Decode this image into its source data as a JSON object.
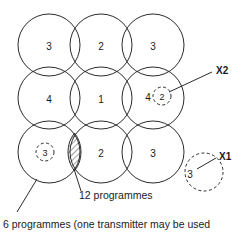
{
  "figure": {
    "stroke_color": "#2b2b2b",
    "background_color": "#ffffff",
    "cells": [
      {
        "id": "cell-r1c1",
        "label": "3",
        "cx": 49,
        "cy": 45,
        "r": 31
      },
      {
        "id": "cell-r1c2",
        "label": "2",
        "cx": 101,
        "cy": 45,
        "r": 31
      },
      {
        "id": "cell-r1c3",
        "label": "3",
        "cx": 153,
        "cy": 45,
        "r": 31
      },
      {
        "id": "cell-r2c1",
        "label": "4",
        "cx": 49,
        "cy": 98,
        "r": 31
      },
      {
        "id": "cell-r2c2",
        "label": "1",
        "cx": 101,
        "cy": 98,
        "r": 31
      },
      {
        "id": "cell-r2c3",
        "label": "4",
        "cx": 153,
        "cy": 98,
        "r": 31
      },
      {
        "id": "cell-r3c1",
        "label": "",
        "cx": 49,
        "cy": 152,
        "r": 31
      },
      {
        "id": "cell-r3c2",
        "label": "2",
        "cx": 101,
        "cy": 152,
        "r": 31
      },
      {
        "id": "cell-r3c3",
        "label": "3",
        "cx": 153,
        "cy": 152,
        "r": 31
      }
    ],
    "small_dashed_cells": [
      {
        "id": "small-dashed-3",
        "label": "3",
        "cx": 45,
        "cy": 152,
        "r": 9
      },
      {
        "id": "small-dashed-2",
        "label": "2",
        "cx": 162,
        "cy": 96,
        "r": 9
      }
    ],
    "x1_marker": {
      "label": "X1",
      "value": "3",
      "cx": 204,
      "cy": 172,
      "r": 19,
      "label_x": 219,
      "label_y": 156,
      "leader": "M 196 168 L 216 158"
    },
    "x2_marker": {
      "label": "X2",
      "label_x": 216,
      "label_y": 70,
      "leader": "M 166 94 L 213 73"
    },
    "overlap_region": {
      "name": "hatched-overlap-lens",
      "leader": "M 74 168 L 80 194"
    },
    "cell_leader": {
      "name": "six-programmes-leader",
      "path": "M 38 178 L 18 211"
    },
    "captions": [
      {
        "id": "caption-12-programmes",
        "text": "12 programmes",
        "x": 79,
        "y": 195
      },
      {
        "id": "caption-6-programmes",
        "text": "6 programmes (one transmitter may be used",
        "x": 3,
        "y": 224
      }
    ]
  }
}
